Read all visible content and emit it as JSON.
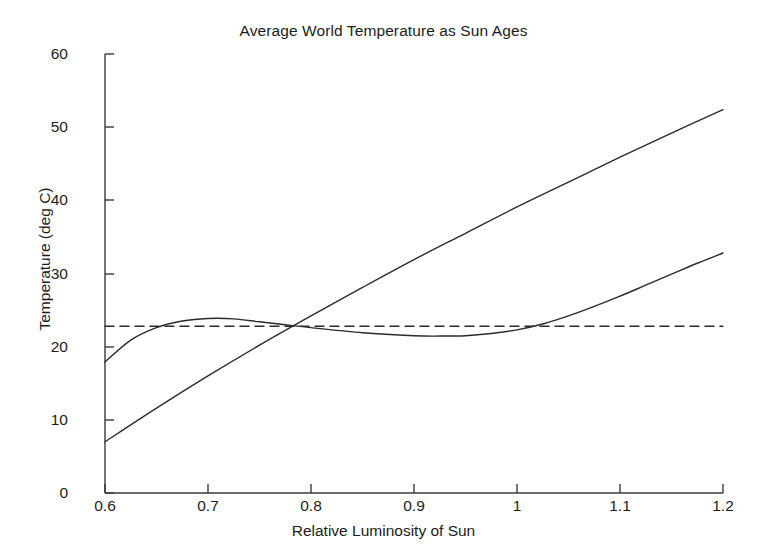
{
  "chart_data": {
    "type": "line",
    "title": "Average World Temperature as Sun Ages",
    "xlabel": "Relative Luminosity of Sun",
    "ylabel": "Temperature (deg C)",
    "xlim": [
      0.6,
      1.2
    ],
    "ylim": [
      0,
      60
    ],
    "xticks": [
      "0.6",
      "0.7",
      "0.8",
      "0.9",
      "1",
      "1.1",
      "1.2"
    ],
    "xtick_values": [
      0.6,
      0.7,
      0.8,
      0.9,
      1.0,
      1.1,
      1.2
    ],
    "yticks": [
      "0",
      "10",
      "20",
      "30",
      "40",
      "50",
      "60"
    ],
    "ytick_values": [
      0,
      10,
      20,
      30,
      40,
      50,
      60
    ],
    "grid": false,
    "legend": "none",
    "line_color": "#2b2b2b",
    "series": [
      {
        "name": "no-feedback temperature",
        "style": "solid",
        "x": [
          0.6,
          0.65,
          0.7,
          0.75,
          0.8,
          0.85,
          0.9,
          0.95,
          1.0,
          1.05,
          1.1,
          1.15,
          1.2
        ],
        "values": [
          7.0,
          11.6,
          16.0,
          20.2,
          24.2,
          28.1,
          31.9,
          35.5,
          39.1,
          42.5,
          45.9,
          49.2,
          52.4
        ]
      },
      {
        "name": "feedback-regulated temperature",
        "style": "solid",
        "x": [
          0.6,
          0.625,
          0.65,
          0.675,
          0.7,
          0.725,
          0.75,
          0.775,
          0.8,
          0.85,
          0.9,
          0.925,
          0.95,
          0.975,
          1.0,
          1.025,
          1.05,
          1.075,
          1.1,
          1.125,
          1.15,
          1.175,
          1.2
        ],
        "values": [
          17.9,
          20.9,
          22.6,
          23.5,
          23.85,
          23.8,
          23.4,
          23.0,
          22.6,
          21.9,
          21.5,
          21.45,
          21.5,
          21.8,
          22.3,
          23.1,
          24.2,
          25.5,
          26.9,
          28.4,
          29.9,
          31.4,
          32.8
        ]
      },
      {
        "name": "equilibrium reference temperature",
        "style": "dashed",
        "x": [
          0.6,
          1.2
        ],
        "values": [
          22.8,
          22.8
        ]
      }
    ]
  }
}
